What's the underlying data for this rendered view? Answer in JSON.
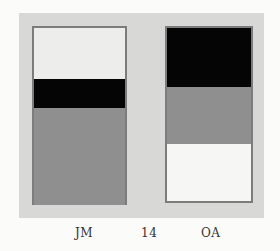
{
  "figure": {
    "colors": {
      "page_background": "#fbfbfa",
      "panel": "#d8d8d6",
      "border": "#7c7c7c",
      "light": "#ededeb",
      "black": "#050505",
      "gray": "#8f8f8f",
      "white": "#f6f6f5"
    },
    "left_box": {
      "label": "JM",
      "bands": [
        {
          "name": "light",
          "top": 0,
          "height": 51
        },
        {
          "name": "black",
          "top": 51,
          "height": 29
        },
        {
          "name": "gray",
          "top": 80,
          "height": 97
        }
      ]
    },
    "right_box": {
      "label": "OA",
      "bands": [
        {
          "name": "black",
          "top": 0,
          "height": 59
        },
        {
          "name": "gray",
          "top": 59,
          "height": 57
        },
        {
          "name": "white",
          "top": 116,
          "height": 57
        }
      ]
    },
    "center_label": "14"
  }
}
